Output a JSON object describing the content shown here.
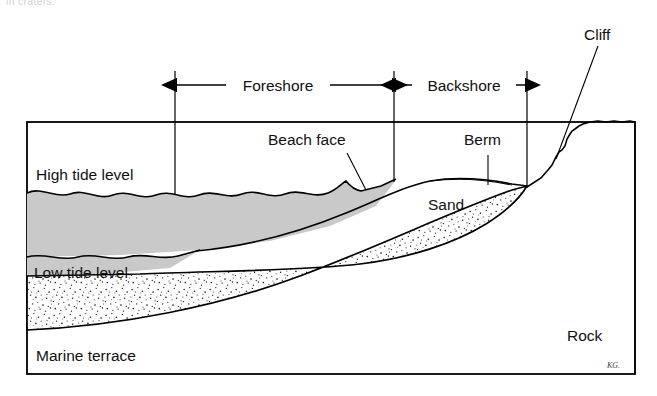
{
  "figure": {
    "title_cut_off": "in craters.",
    "signature": "KG.",
    "colors": {
      "water": "#c9c9c9",
      "sand_base": "#fdfdfd",
      "sand_speckle": "#1a1a1a",
      "line": "#000000",
      "background": "#ffffff"
    }
  },
  "labels": {
    "foreshore": "Foreshore",
    "backshore": "Backshore",
    "beach_face": "Beach face",
    "berm": "Berm",
    "cliff": "Cliff",
    "high_tide_level": "High tide level",
    "low_tide_level": "Low tide level",
    "sand": "Sand",
    "rock": "Rock",
    "marine_terrace": "Marine terrace"
  },
  "zones": [
    {
      "name": "Foreshore",
      "from_x": 175,
      "to_x": 394
    },
    {
      "name": "Backshore",
      "from_x": 394,
      "to_x": 527
    }
  ],
  "features": [
    {
      "name": "High tide level",
      "kind": "water-surface"
    },
    {
      "name": "Low tide level",
      "kind": "water-surface"
    },
    {
      "name": "Beach face",
      "kind": "slope"
    },
    {
      "name": "Berm",
      "kind": "flat-crest"
    },
    {
      "name": "Cliff",
      "kind": "scarp"
    },
    {
      "name": "Sand",
      "kind": "sediment"
    },
    {
      "name": "Rock",
      "kind": "bedrock"
    },
    {
      "name": "Marine terrace",
      "kind": "bedrock-platform"
    }
  ],
  "frame": {
    "left": 27,
    "top": 122,
    "right": 635,
    "bottom": 374
  }
}
